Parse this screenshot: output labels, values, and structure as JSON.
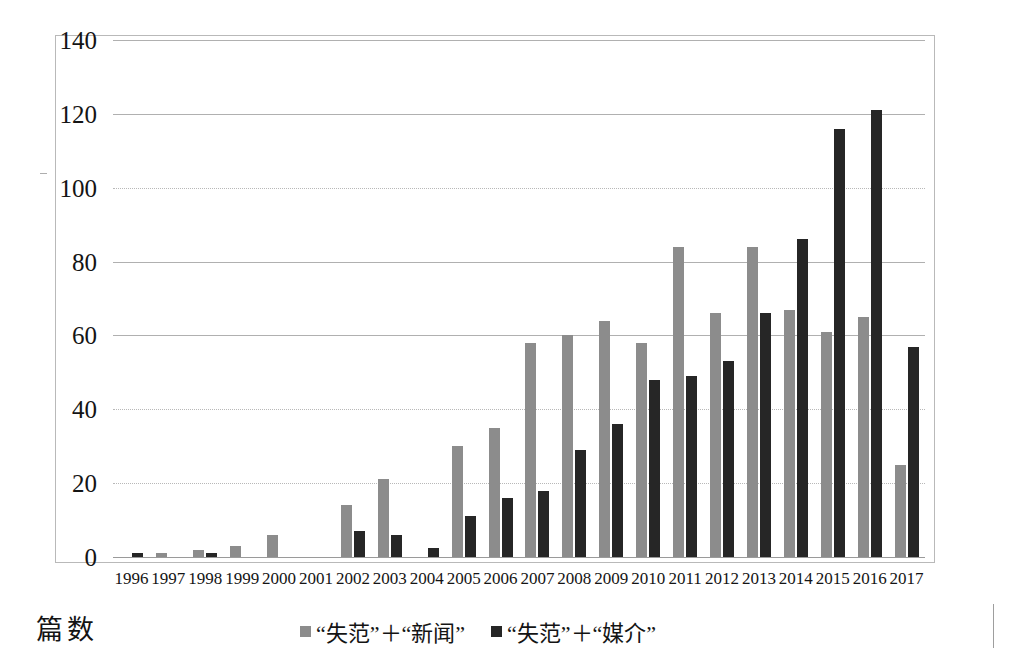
{
  "axis_title": "篇数",
  "legend": [
    {
      "label": "“失范”＋“新闻”",
      "color": "#8c8c8c",
      "key": "s1"
    },
    {
      "label": "“失范”＋“媒介”",
      "color": "#262626",
      "key": "s2"
    }
  ],
  "chart_data": {
    "type": "bar",
    "title": "",
    "xlabel": "",
    "ylabel": "篇数",
    "ylim": [
      0,
      140
    ],
    "yticks": [
      0,
      20,
      40,
      60,
      80,
      100,
      120,
      140
    ],
    "grid": true,
    "legend_position": "bottom",
    "categories": [
      "1996",
      "1997",
      "1998",
      "1999",
      "2000",
      "2001",
      "2002",
      "2003",
      "2004",
      "2005",
      "2006",
      "2007",
      "2008",
      "2009",
      "2010",
      "2011",
      "2012",
      "2013",
      "2014",
      "2015",
      "2016",
      "2017"
    ],
    "series": [
      {
        "name": "“失范”＋“新闻”",
        "color": "#8c8c8c",
        "values": [
          0,
          1,
          2,
          3,
          6,
          0,
          14,
          21,
          0,
          30,
          35,
          58,
          60,
          64,
          58,
          84,
          66,
          84,
          67,
          61,
          65,
          25
        ]
      },
      {
        "name": "“失范”＋“媒介”",
        "color": "#262626",
        "values": [
          1,
          0,
          1,
          0,
          0,
          0,
          7,
          6,
          2.5,
          11,
          16,
          18,
          29,
          36,
          48,
          49,
          53,
          66,
          86,
          116,
          121,
          57
        ]
      }
    ]
  }
}
